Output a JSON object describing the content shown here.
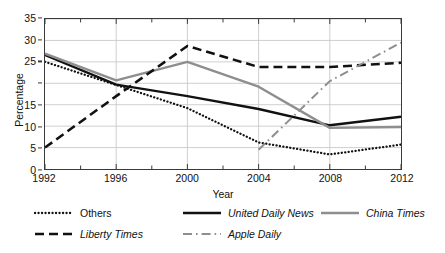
{
  "chart_data": {
    "type": "line",
    "title": "",
    "xlabel": "Year",
    "ylabel": "Percentage",
    "x": [
      1992,
      1994,
      1996,
      1998,
      2000,
      2002,
      2004,
      2006,
      2008,
      2010,
      2012
    ],
    "xlim": [
      1992,
      2012
    ],
    "ylim": [
      0,
      35
    ],
    "xticks": [
      1992,
      1996,
      2000,
      2004,
      2008,
      2012
    ],
    "xtick_labels": [
      "1992",
      "1996",
      "2000",
      "2004",
      "2008",
      "2012"
    ],
    "yticks": [
      0,
      5,
      10,
      15,
      20,
      25,
      30,
      35
    ],
    "ytick_labels": [
      "0",
      "5",
      "10",
      "15",
      "",
      "25",
      "30",
      "35"
    ],
    "grid": true,
    "legend_position": "below",
    "series": [
      {
        "name": "Others",
        "style": "dotted",
        "color": "#111111",
        "x": [
          1992,
          1996,
          2000,
          2004,
          2008,
          2012
        ],
        "values": [
          25.0,
          19.6,
          14.2,
          6.2,
          3.4,
          5.7
        ]
      },
      {
        "name": "United Daily News",
        "style": "solid",
        "color": "#111111",
        "x": [
          1992,
          1996,
          2000,
          2004,
          2008,
          2012
        ],
        "values": [
          26.6,
          19.7,
          17.0,
          14.0,
          10.2,
          12.2
        ]
      },
      {
        "name": "China Times",
        "style": "solid",
        "color": "#8e8e8e",
        "x": [
          1992,
          1996,
          2000,
          2004,
          2008,
          2012
        ],
        "values": [
          26.9,
          20.7,
          25.0,
          19.2,
          9.6,
          9.8
        ]
      },
      {
        "name": "Liberty Times",
        "style": "dashed",
        "color": "#111111",
        "x": [
          1992,
          1996,
          2000,
          2004,
          2008,
          2012
        ],
        "values": [
          5.0,
          17.0,
          28.7,
          23.8,
          23.8,
          24.8
        ]
      },
      {
        "name": "Apple Daily",
        "style": "dashdot",
        "color": "#8e8e8e",
        "x": [
          2004,
          2008,
          2012
        ],
        "values": [
          4.5,
          20.5,
          29.5
        ]
      }
    ]
  },
  "legend": {
    "rows": [
      [
        {
          "label": "Others",
          "series": 0
        },
        {
          "label": "United Daily News",
          "series": 1
        },
        {
          "label": "China Times",
          "series": 2
        }
      ],
      [
        {
          "label": "Liberty Times",
          "series": 3
        },
        {
          "label": "Apple Daily",
          "series": 4
        }
      ]
    ]
  },
  "colors": {
    "black": "#111111",
    "gray": "#8e8e8e",
    "grid": "#c9c9c9",
    "frame": "#3a3a3a"
  }
}
